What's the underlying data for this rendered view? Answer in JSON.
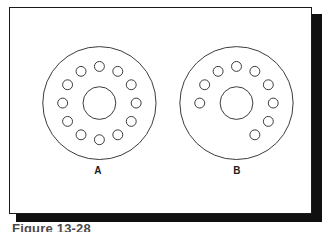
{
  "figure": {
    "caption": "Figure 13-28",
    "frame": {
      "border_color": "#1a1a1a",
      "background": "#ffffff",
      "shadow_color": "#101010"
    },
    "stroke_color": "#3a3a3a",
    "parts": [
      {
        "label": "A",
        "description": "Flange face with twelve equally spaced bolt holes on a full bolt circle",
        "outer_diameter_px": 114,
        "center_bore_diameter_px": 33,
        "bolt_circle_diameter_px": 74,
        "hole_diameter_px": 10,
        "hole_count": 12,
        "hole_span_degrees": 360,
        "hole_angles_deg": [
          0,
          30,
          60,
          90,
          120,
          150,
          180,
          210,
          240,
          270,
          300,
          330
        ],
        "center": {
          "x": 90,
          "y": 96
        }
      },
      {
        "label": "B",
        "description": "Flange face with nine bolt holes grouped around the lower arc of the bolt circle",
        "outer_diameter_px": 114,
        "center_bore_diameter_px": 33,
        "bolt_circle_diameter_px": 74,
        "hole_diameter_px": 10,
        "hole_count": 9,
        "hole_span_degrees": 240,
        "hole_angles_deg": [
          0,
          30,
          60,
          90,
          120,
          150,
          180,
          210,
          240
        ],
        "center": {
          "x": 228,
          "y": 96
        }
      }
    ]
  }
}
